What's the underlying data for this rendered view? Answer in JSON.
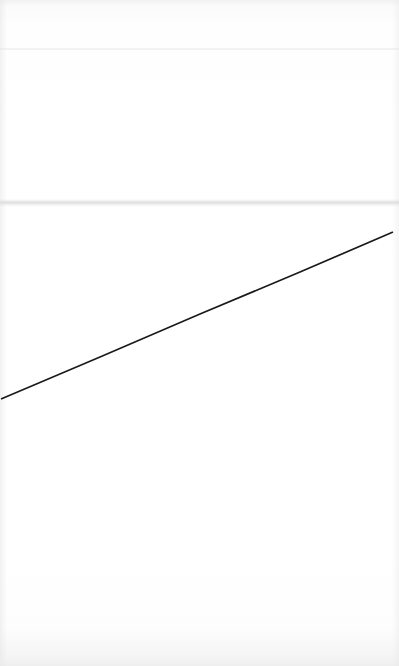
{
  "page": {
    "width": 399,
    "height": 666,
    "background_color": "#fefefe",
    "content_description": "Blank scanned page with a single ruled diagonal line",
    "visible_text": ""
  },
  "artifacts": {
    "top_noise_band_label": "scan-noise-top",
    "bottom_noise_band_label": "scan-noise-bottom",
    "upper_seam_label": "scan-seam-upper",
    "mid_seam_label": "scan-seam-mid",
    "left_edge_label": "page-edge-left",
    "right_edge_label": "page-edge-right"
  },
  "chart_data": {
    "type": "line",
    "title": "",
    "subtitle": "",
    "xlabel": "",
    "ylabel": "",
    "grid": false,
    "legend": null,
    "axis_visible": false,
    "tick_labels_x": [],
    "tick_labels_y": [],
    "xlim": [
      0,
      399
    ],
    "ylim": [
      0,
      666
    ],
    "stroke_color": "#1a1a1a",
    "stroke_width": 1.7,
    "series": [
      {
        "name": "diagonal-line",
        "points": [
          {
            "x": 1,
            "y": 399
          },
          {
            "x": 100,
            "y": 357
          },
          {
            "x": 200,
            "y": 314
          },
          {
            "x": 300,
            "y": 272
          },
          {
            "x": 393,
            "y": 232
          }
        ]
      }
    ],
    "annotations": []
  }
}
